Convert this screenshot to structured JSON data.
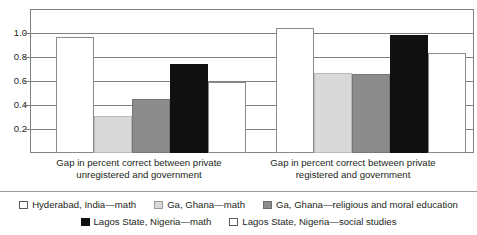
{
  "chart_data": {
    "type": "bar",
    "title": "",
    "xlabel": "",
    "ylabel": "",
    "ylim": [
      0,
      1.2
    ],
    "grid": true,
    "legend_position": "bottom",
    "categories": [
      "Gap in percent correct between private unregistered and government",
      "Gap in percent correct between private registered and government"
    ],
    "category_lines": [
      [
        "Gap in percent correct between private",
        "unregistered and government"
      ],
      [
        "Gap in percent correct between private",
        "registered and government"
      ]
    ],
    "ytick_labels": [
      "1.0",
      "0.8",
      "0.6",
      "0.4",
      "0.2"
    ],
    "ytick_values": [
      1.0,
      0.8,
      0.6,
      0.4,
      0.2
    ],
    "series": [
      {
        "name": "Hyderabad, India—math",
        "color": "#ffffff",
        "swatch": "c-white",
        "values": [
          0.97,
          1.04
        ]
      },
      {
        "name": "Ga, Ghana—math",
        "color": "#d9d9d9",
        "swatch": "c-lightgray",
        "values": [
          0.31,
          0.67
        ]
      },
      {
        "name": "Ga, Ghana—religious and moral education",
        "color": "#8c8c8c",
        "swatch": "c-midgray",
        "values": [
          0.45,
          0.66
        ]
      },
      {
        "name": "Lagos State, Nigeria—math",
        "color": "#101010",
        "swatch": "c-black",
        "values": [
          0.74,
          0.985
        ]
      },
      {
        "name": "Lagos State, Nigeria—social studies",
        "color": "#ffffff",
        "swatch": "c-white",
        "values": [
          0.59,
          0.83
        ]
      }
    ],
    "legend_rows": [
      [
        0,
        1,
        2
      ],
      [
        3,
        4
      ]
    ]
  }
}
